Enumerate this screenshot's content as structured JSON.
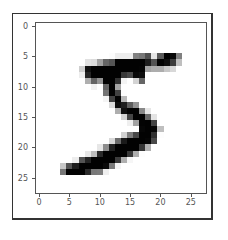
{
  "chart_data": {
    "type": "heatmap",
    "title": "",
    "xlabel": "",
    "ylabel": "",
    "colormap": "gray_r",
    "xlim": [
      -0.5,
      27.5
    ],
    "ylim": [
      27.5,
      -0.5
    ],
    "xticks": [
      0,
      5,
      10,
      15,
      20,
      25
    ],
    "yticks": [
      0,
      5,
      10,
      15,
      20,
      25
    ],
    "xtick_labels": [
      "0",
      "5",
      "10",
      "15",
      "20",
      "25"
    ],
    "ytick_labels": [
      "0",
      "5",
      "10",
      "15",
      "20",
      "25"
    ],
    "grid": false,
    "shape": [
      28,
      28
    ],
    "values": [
      [
        0,
        0,
        0,
        0,
        0,
        0,
        0,
        0,
        0,
        0,
        0,
        0,
        0,
        0,
        0,
        0,
        0,
        0,
        0,
        0,
        0,
        0,
        0,
        0,
        0,
        0,
        0,
        0
      ],
      [
        0,
        0,
        0,
        0,
        0,
        0,
        0,
        0,
        0,
        0,
        0,
        0,
        0,
        0,
        0,
        0,
        0,
        0,
        0,
        0,
        0,
        0,
        0,
        0,
        0,
        0,
        0,
        0
      ],
      [
        0,
        0,
        0,
        0,
        0,
        0,
        0,
        0,
        0,
        0,
        0,
        0,
        0,
        0,
        0,
        0,
        0,
        0,
        0,
        0,
        0,
        0,
        0,
        0,
        0,
        0,
        0,
        0
      ],
      [
        0,
        0,
        0,
        0,
        0,
        0,
        0,
        0,
        0,
        0,
        0,
        0,
        0,
        0,
        0,
        0,
        0,
        0,
        0,
        0,
        0,
        0,
        0,
        0,
        0,
        0,
        0,
        0
      ],
      [
        0,
        0,
        0,
        0,
        0,
        0,
        0,
        0,
        0,
        0,
        0,
        0,
        0,
        0,
        0,
        0,
        0,
        0,
        0,
        0,
        0,
        0,
        0,
        0,
        0,
        0,
        0,
        0
      ],
      [
        0,
        0,
        0,
        0,
        0,
        0,
        0,
        0,
        0,
        0,
        0,
        0,
        3,
        18,
        18,
        18,
        126,
        136,
        175,
        26,
        166,
        255,
        247,
        127,
        0,
        0,
        0,
        0
      ],
      [
        0,
        0,
        0,
        0,
        0,
        0,
        0,
        0,
        30,
        36,
        94,
        154,
        170,
        253,
        253,
        253,
        253,
        253,
        225,
        172,
        253,
        242,
        195,
        64,
        0,
        0,
        0,
        0
      ],
      [
        0,
        0,
        0,
        0,
        0,
        0,
        0,
        49,
        238,
        253,
        253,
        253,
        253,
        253,
        253,
        253,
        253,
        251,
        93,
        82,
        82,
        56,
        39,
        0,
        0,
        0,
        0,
        0
      ],
      [
        0,
        0,
        0,
        0,
        0,
        0,
        0,
        18,
        219,
        253,
        253,
        253,
        253,
        253,
        198,
        182,
        247,
        241,
        0,
        0,
        0,
        0,
        0,
        0,
        0,
        0,
        0,
        0
      ],
      [
        0,
        0,
        0,
        0,
        0,
        0,
        0,
        0,
        80,
        156,
        107,
        253,
        253,
        205,
        11,
        0,
        43,
        154,
        0,
        0,
        0,
        0,
        0,
        0,
        0,
        0,
        0,
        0
      ],
      [
        0,
        0,
        0,
        0,
        0,
        0,
        0,
        0,
        0,
        14,
        1,
        154,
        253,
        90,
        0,
        0,
        0,
        0,
        0,
        0,
        0,
        0,
        0,
        0,
        0,
        0,
        0,
        0
      ],
      [
        0,
        0,
        0,
        0,
        0,
        0,
        0,
        0,
        0,
        0,
        0,
        139,
        253,
        190,
        2,
        0,
        0,
        0,
        0,
        0,
        0,
        0,
        0,
        0,
        0,
        0,
        0,
        0
      ],
      [
        0,
        0,
        0,
        0,
        0,
        0,
        0,
        0,
        0,
        0,
        0,
        11,
        190,
        253,
        70,
        0,
        0,
        0,
        0,
        0,
        0,
        0,
        0,
        0,
        0,
        0,
        0,
        0
      ],
      [
        0,
        0,
        0,
        0,
        0,
        0,
        0,
        0,
        0,
        0,
        0,
        0,
        35,
        241,
        225,
        160,
        108,
        1,
        0,
        0,
        0,
        0,
        0,
        0,
        0,
        0,
        0,
        0
      ],
      [
        0,
        0,
        0,
        0,
        0,
        0,
        0,
        0,
        0,
        0,
        0,
        0,
        0,
        81,
        240,
        253,
        253,
        119,
        25,
        0,
        0,
        0,
        0,
        0,
        0,
        0,
        0,
        0
      ],
      [
        0,
        0,
        0,
        0,
        0,
        0,
        0,
        0,
        0,
        0,
        0,
        0,
        0,
        0,
        45,
        186,
        253,
        253,
        150,
        27,
        0,
        0,
        0,
        0,
        0,
        0,
        0,
        0
      ],
      [
        0,
        0,
        0,
        0,
        0,
        0,
        0,
        0,
        0,
        0,
        0,
        0,
        0,
        0,
        0,
        16,
        93,
        252,
        253,
        187,
        0,
        0,
        0,
        0,
        0,
        0,
        0,
        0
      ],
      [
        0,
        0,
        0,
        0,
        0,
        0,
        0,
        0,
        0,
        0,
        0,
        0,
        0,
        0,
        0,
        0,
        0,
        249,
        253,
        249,
        64,
        0,
        0,
        0,
        0,
        0,
        0,
        0
      ],
      [
        0,
        0,
        0,
        0,
        0,
        0,
        0,
        0,
        0,
        0,
        0,
        0,
        0,
        0,
        46,
        130,
        183,
        253,
        253,
        207,
        2,
        0,
        0,
        0,
        0,
        0,
        0,
        0
      ],
      [
        0,
        0,
        0,
        0,
        0,
        0,
        0,
        0,
        0,
        0,
        0,
        0,
        39,
        148,
        229,
        253,
        253,
        253,
        250,
        182,
        0,
        0,
        0,
        0,
        0,
        0,
        0,
        0
      ],
      [
        0,
        0,
        0,
        0,
        0,
        0,
        0,
        0,
        0,
        0,
        24,
        114,
        221,
        253,
        253,
        253,
        253,
        201,
        78,
        0,
        0,
        0,
        0,
        0,
        0,
        0,
        0,
        0
      ],
      [
        0,
        0,
        0,
        0,
        0,
        0,
        0,
        0,
        23,
        66,
        213,
        253,
        253,
        253,
        253,
        198,
        81,
        2,
        0,
        0,
        0,
        0,
        0,
        0,
        0,
        0,
        0,
        0
      ],
      [
        0,
        0,
        0,
        0,
        0,
        0,
        18,
        171,
        219,
        253,
        253,
        253,
        253,
        195,
        80,
        9,
        0,
        0,
        0,
        0,
        0,
        0,
        0,
        0,
        0,
        0,
        0,
        0
      ],
      [
        0,
        0,
        0,
        0,
        55,
        172,
        226,
        253,
        253,
        253,
        253,
        244,
        133,
        11,
        0,
        0,
        0,
        0,
        0,
        0,
        0,
        0,
        0,
        0,
        0,
        0,
        0,
        0
      ],
      [
        0,
        0,
        0,
        0,
        136,
        253,
        253,
        253,
        212,
        135,
        132,
        16,
        0,
        0,
        0,
        0,
        0,
        0,
        0,
        0,
        0,
        0,
        0,
        0,
        0,
        0,
        0,
        0
      ],
      [
        0,
        0,
        0,
        0,
        0,
        0,
        0,
        0,
        0,
        0,
        0,
        0,
        0,
        0,
        0,
        0,
        0,
        0,
        0,
        0,
        0,
        0,
        0,
        0,
        0,
        0,
        0,
        0
      ],
      [
        0,
        0,
        0,
        0,
        0,
        0,
        0,
        0,
        0,
        0,
        0,
        0,
        0,
        0,
        0,
        0,
        0,
        0,
        0,
        0,
        0,
        0,
        0,
        0,
        0,
        0,
        0,
        0
      ],
      [
        0,
        0,
        0,
        0,
        0,
        0,
        0,
        0,
        0,
        0,
        0,
        0,
        0,
        0,
        0,
        0,
        0,
        0,
        0,
        0,
        0,
        0,
        0,
        0,
        0,
        0,
        0,
        0
      ]
    ]
  }
}
